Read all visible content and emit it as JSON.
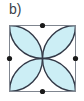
{
  "figure": {
    "panel_label": "b)",
    "colors": {
      "petal_fill": "#cceef5",
      "arc_stroke": "#333a48",
      "square_stroke": "#808690",
      "dot_fill": "#1a1a1a",
      "label_text": "#3a3f4a",
      "background": "#ffffff"
    },
    "square": {
      "x": 9.5,
      "y": 25.5,
      "size": 66,
      "stroke_width": 1
    },
    "arcs": {
      "count": 4,
      "radius": 33,
      "centers": [
        {
          "name": "top-midpoint",
          "x": 42.5,
          "y": 25.5
        },
        {
          "name": "right-midpoint",
          "x": 75.5,
          "y": 58.5
        },
        {
          "name": "bottom-midpoint",
          "x": 42.5,
          "y": 91.5
        },
        {
          "name": "left-midpoint",
          "x": 9.5,
          "y": 58.5
        }
      ],
      "stroke_width": 1.4
    },
    "petals": {
      "count": 4,
      "orientation": "diagonal-toward-corners",
      "center": {
        "x": 42.5,
        "y": 58.5
      }
    },
    "dots": [
      {
        "name": "top-midpoint-dot",
        "x": 42.5,
        "y": 25.5,
        "r": 2.6
      },
      {
        "name": "right-midpoint-dot",
        "x": 75.5,
        "y": 58.5,
        "r": 2.6
      },
      {
        "name": "bottom-midpoint-dot",
        "x": 42.5,
        "y": 91.5,
        "r": 2.6
      },
      {
        "name": "left-midpoint-dot",
        "x": 9.5,
        "y": 58.5,
        "r": 2.6
      }
    ]
  }
}
